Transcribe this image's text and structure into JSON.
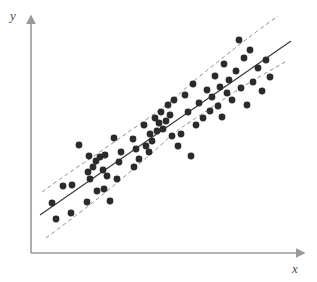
{
  "figure": {
    "name": "scatter-plot-with-regression-and-confidence-bands",
    "background_color": "#ffffff"
  },
  "axes": {
    "x_label": "x",
    "y_label": "y",
    "axis_color": "#9a9a9a",
    "origin": {
      "x": 31,
      "y": 253
    },
    "x_end": {
      "x": 306,
      "y": 253
    },
    "y_top": {
      "x": 31,
      "y": 14
    },
    "arrowheads": true,
    "ticks": false,
    "grid": false
  },
  "style": {
    "point_color": "#2b2b2b",
    "point_radius": 3.4,
    "regression_line_color": "#3a3a3a",
    "regression_line_width": 1.2,
    "band_color": "#8c8c8c",
    "band_width": 1,
    "band_dash": "4 3"
  },
  "chart_data": {
    "type": "scatter",
    "title": "",
    "xlabel": "x",
    "ylabel": "y",
    "xlim": [
      31,
      306
    ],
    "ylim": [
      253,
      14
    ],
    "grid": false,
    "legend": false,
    "annotations": [],
    "series": [
      {
        "name": "observations",
        "marker": "filled-circle",
        "color": "#2b2b2b",
        "points": [
          [
            52,
            203
          ],
          [
            56,
            219
          ],
          [
            63,
            186
          ],
          [
            71,
            213
          ],
          [
            72,
            185
          ],
          [
            79,
            145
          ],
          [
            87,
            202
          ],
          [
            88,
            172
          ],
          [
            89,
            156
          ],
          [
            90,
            179
          ],
          [
            93,
            167
          ],
          [
            96,
            161
          ],
          [
            97,
            191
          ],
          [
            100,
            157
          ],
          [
            103,
            170
          ],
          [
            104,
            189
          ],
          [
            105,
            155
          ],
          [
            107,
            176
          ],
          [
            110,
            201
          ],
          [
            114,
            138
          ],
          [
            117,
            179
          ],
          [
            119,
            162
          ],
          [
            121,
            152
          ],
          [
            133,
            139
          ],
          [
            134,
            167
          ],
          [
            136,
            149
          ],
          [
            139,
            159
          ],
          [
            144,
            125
          ],
          [
            146,
            146
          ],
          [
            149,
            152
          ],
          [
            150,
            134
          ],
          [
            152,
            141
          ],
          [
            155,
            118
          ],
          [
            157,
            131
          ],
          [
            159,
            123
          ],
          [
            161,
            112
          ],
          [
            163,
            129
          ],
          [
            166,
            121
          ],
          [
            168,
            105
          ],
          [
            170,
            115
          ],
          [
            172,
            136
          ],
          [
            174,
            100
          ],
          [
            178,
            146
          ],
          [
            181,
            134
          ],
          [
            185,
            95
          ],
          [
            188,
            112
          ],
          [
            191,
            156
          ],
          [
            193,
            84
          ],
          [
            196,
            125
          ],
          [
            199,
            103
          ],
          [
            203,
            118
          ],
          [
            207,
            90
          ],
          [
            210,
            111
          ],
          [
            212,
            97
          ],
          [
            215,
            76
          ],
          [
            218,
            106
          ],
          [
            220,
            87
          ],
          [
            222,
            117
          ],
          [
            224,
            64
          ],
          [
            227,
            93
          ],
          [
            229,
            80
          ],
          [
            232,
            100
          ],
          [
            236,
            71
          ],
          [
            239,
            40
          ],
          [
            241,
            88
          ],
          [
            244,
            58
          ],
          [
            247,
            105
          ],
          [
            250,
            50
          ],
          [
            253,
            82
          ],
          [
            258,
            68
          ],
          [
            262,
            91
          ],
          [
            266,
            60
          ],
          [
            270,
            77
          ]
        ]
      }
    ],
    "fit_lines": [
      {
        "name": "regression-line",
        "style": "solid",
        "color": "#3a3a3a",
        "x1": 40,
        "y1": 215,
        "x2": 291,
        "y2": 41
      }
    ],
    "confidence_bands": [
      {
        "name": "upper-confidence-band",
        "style": "dashed",
        "color": "#8c8c8c",
        "path_points": [
          [
            42,
            192
          ],
          [
            70,
            172
          ],
          [
            100,
            152
          ],
          [
            130,
            131
          ],
          [
            160,
            110
          ],
          [
            175,
            98
          ],
          [
            190,
            84
          ],
          [
            215,
            64
          ],
          [
            245,
            40
          ],
          [
            278,
            16
          ]
        ]
      },
      {
        "name": "lower-confidence-band",
        "style": "dashed",
        "color": "#8c8c8c",
        "path_points": [
          [
            46,
            238
          ],
          [
            70,
            220
          ],
          [
            100,
            197
          ],
          [
            130,
            172
          ],
          [
            160,
            146
          ],
          [
            175,
            132
          ],
          [
            190,
            122
          ],
          [
            215,
            105
          ],
          [
            245,
            85
          ],
          [
            285,
            62
          ]
        ]
      }
    ]
  }
}
